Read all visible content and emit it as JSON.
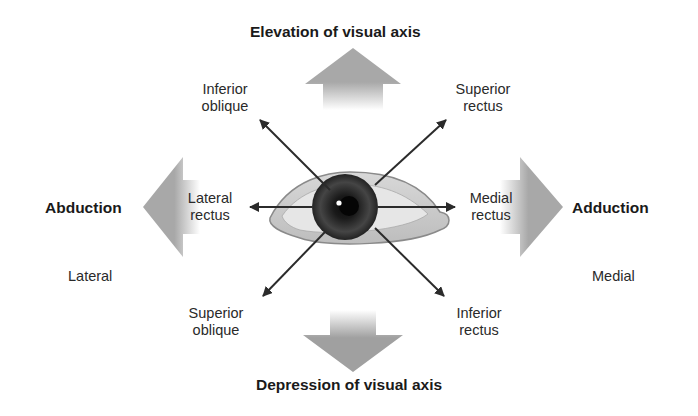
{
  "diagram": {
    "title_top": "Elevation of visual axis",
    "title_bottom": "Depression of visual axis",
    "left_action": "Abduction",
    "right_action": "Adduction",
    "left_side": "Lateral",
    "right_side": "Medial",
    "muscles": {
      "inferior_oblique": [
        "Inferior",
        "oblique"
      ],
      "superior_rectus": [
        "Superior",
        "rectus"
      ],
      "lateral_rectus": [
        "Lateral",
        "rectus"
      ],
      "medial_rectus": [
        "Medial",
        "rectus"
      ],
      "superior_oblique": [
        "Superior",
        "oblique"
      ],
      "inferior_rectus": [
        "Inferior",
        "rectus"
      ]
    },
    "colors": {
      "big_arrow": "#a9a9a9",
      "line": "#2b2b2b",
      "iris": "#333333"
    }
  }
}
